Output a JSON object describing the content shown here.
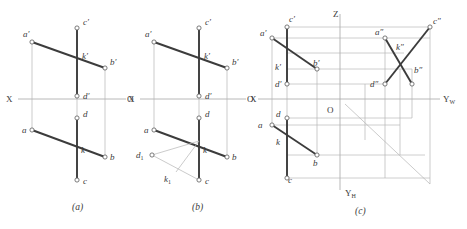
{
  "figure": {
    "stroke_thin": "#a6a6a6",
    "stroke_thick": "#3c3c3c",
    "text_color": "#3a3a3a",
    "background": "#ffffff"
  },
  "captions": [
    {
      "key": "a",
      "text": "(a)"
    },
    {
      "key": "b",
      "text": "(b)"
    },
    {
      "key": "c",
      "text": "(c)"
    }
  ],
  "panel_a": {
    "axis_labels": {
      "x_left": "X",
      "origin": "O"
    },
    "points": [
      {
        "name": "a-prime",
        "label": "a′"
      },
      {
        "name": "b-prime",
        "label": "b′"
      },
      {
        "name": "c-prime",
        "label": "c′"
      },
      {
        "name": "d-prime",
        "label": "d′"
      },
      {
        "name": "k-prime",
        "label": "k′"
      },
      {
        "name": "a",
        "label": "a"
      },
      {
        "name": "b",
        "label": "b"
      },
      {
        "name": "c",
        "label": "c"
      },
      {
        "name": "d",
        "label": "d"
      },
      {
        "name": "k",
        "label": "k"
      }
    ]
  },
  "panel_b": {
    "axis_labels": {
      "x_left": "X",
      "origin": "O"
    },
    "points": [
      {
        "name": "a-prime",
        "label": "a′"
      },
      {
        "name": "b-prime",
        "label": "b′"
      },
      {
        "name": "c-prime",
        "label": "c′"
      },
      {
        "name": "d-prime",
        "label": "d′"
      },
      {
        "name": "k-prime",
        "label": "k′"
      },
      {
        "name": "a",
        "label": "a"
      },
      {
        "name": "b",
        "label": "b"
      },
      {
        "name": "c",
        "label": "c"
      },
      {
        "name": "d",
        "label": "d"
      },
      {
        "name": "k",
        "label": "k"
      },
      {
        "name": "d-one",
        "label": "d",
        "subscript": "1"
      },
      {
        "name": "k-one",
        "label": "k",
        "subscript": "1"
      }
    ]
  },
  "panel_c": {
    "axis_labels": {
      "x_left": "X",
      "origin": "O",
      "z_axis": "Z",
      "y_w_axis": "Y",
      "y_w_sub": "W",
      "y_h_axis": "Y",
      "y_h_sub": "H"
    },
    "points": [
      {
        "name": "a-prime",
        "label": "a′"
      },
      {
        "name": "b-prime",
        "label": "b′"
      },
      {
        "name": "c-prime",
        "label": "c′"
      },
      {
        "name": "d-prime",
        "label": "d′"
      },
      {
        "name": "k-prime",
        "label": "k′"
      },
      {
        "name": "a",
        "label": "a"
      },
      {
        "name": "b",
        "label": "b"
      },
      {
        "name": "c",
        "label": "c"
      },
      {
        "name": "d",
        "label": "d"
      },
      {
        "name": "k",
        "label": "k"
      },
      {
        "name": "a-double-prime",
        "label": "a″"
      },
      {
        "name": "b-double-prime",
        "label": "b″"
      },
      {
        "name": "c-double-prime",
        "label": "c″"
      },
      {
        "name": "d-double-prime",
        "label": "d″"
      },
      {
        "name": "k-double-prime",
        "label": "k″"
      }
    ]
  }
}
